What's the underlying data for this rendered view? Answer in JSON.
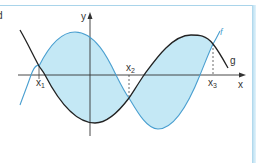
{
  "figure": {
    "part_label": "d",
    "axes": {
      "x_label": "x",
      "y_label": "y"
    },
    "curves": [
      {
        "name": "f",
        "label": "f",
        "color": "#4a9fd0",
        "description": "sine-like curve rising from bottom-left, max left of y-axis, min right of x2"
      },
      {
        "name": "g",
        "label": "g",
        "color": "#222222",
        "description": "sine-like curve falling from top-left, min near y-axis, max right of x2"
      }
    ],
    "intersections": [
      {
        "label": "x",
        "subscript": "1"
      },
      {
        "label": "x",
        "subscript": "2"
      },
      {
        "label": "x",
        "subscript": "3"
      }
    ],
    "shading": {
      "color": "#c4e8f5",
      "region": "area enclosed between f and g from x1 to x3"
    },
    "frame_color": "#a9d4ea"
  }
}
